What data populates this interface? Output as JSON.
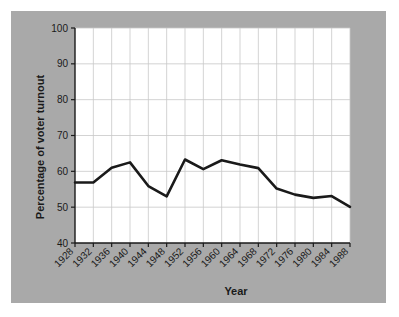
{
  "chart_data": {
    "type": "line",
    "title": "",
    "xlabel": "Year",
    "ylabel": "Percentage of voter turnout",
    "categories": [
      1928,
      1932,
      1936,
      1940,
      1944,
      1948,
      1952,
      1956,
      1960,
      1964,
      1968,
      1972,
      1976,
      1980,
      1984,
      1988
    ],
    "x_tick_labels": [
      "1928",
      "1932",
      "1936",
      "1940",
      "1944",
      "1948",
      "1952",
      "1956",
      "1960",
      "1964",
      "1968",
      "1972",
      "1976",
      "1980",
      "1984",
      "1988"
    ],
    "values": [
      56.9,
      56.9,
      61.0,
      62.5,
      55.9,
      53.0,
      63.3,
      60.6,
      63.1,
      61.9,
      60.9,
      55.2,
      53.5,
      52.6,
      53.1,
      50.1
    ],
    "series": [
      {
        "name": "Percentage of voter turnout",
        "values": [
          56.9,
          56.9,
          61.0,
          62.5,
          55.9,
          53.0,
          63.3,
          60.6,
          63.1,
          61.9,
          60.9,
          55.2,
          53.5,
          52.6,
          53.1,
          50.1
        ]
      }
    ],
    "ylim": [
      40,
      100
    ],
    "y_ticks": [
      40,
      50,
      60,
      70,
      80,
      90,
      100
    ],
    "y_tick_labels": [
      "40",
      "50",
      "60",
      "70",
      "80",
      "90",
      "100"
    ],
    "xlim": [
      1928,
      1988
    ],
    "grid": true,
    "legend": "none",
    "line_color": "#1a1a1a",
    "plot_background": "#ffffff",
    "figure_background": "#a9a9a9",
    "grid_color": "#c8c8c8"
  }
}
